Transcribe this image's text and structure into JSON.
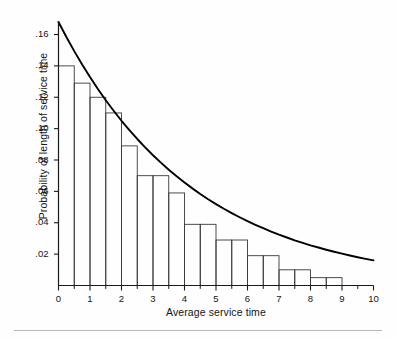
{
  "chart_data": {
    "type": "bar",
    "title": "",
    "subtitle": "",
    "xlabel": "Average service time",
    "ylabel": "Probability of length of service time",
    "xlim": [
      0,
      10
    ],
    "ylim": [
      0,
      0.172
    ],
    "grid": false,
    "legend": null,
    "bar_width": 0.5,
    "categories": [
      "0.0-0.5",
      "0.5-1.0",
      "1.0-1.5",
      "1.5-2.0",
      "2.0-2.5",
      "2.5-3.0",
      "3.0-3.5",
      "3.5-4.0",
      "4.0-4.5",
      "4.5-5.0",
      "5.0-5.5",
      "5.5-6.0",
      "6.0-6.5",
      "6.5-7.0",
      "7.0-7.5",
      "7.5-8.0",
      "8.0-8.5",
      "8.5-9.0",
      "9.0-9.5",
      "9.5-10.0"
    ],
    "bar_left_edges": [
      0,
      0.5,
      1,
      1.5,
      2,
      2.5,
      3,
      3.5,
      4,
      4.5,
      5,
      5.5,
      6,
      6.5,
      7,
      7.5,
      8,
      8.5,
      9,
      9.5
    ],
    "values": [
      0.14,
      0.129,
      0.12,
      0.11,
      0.089,
      0.07,
      0.07,
      0.059,
      0.039,
      0.039,
      0.029,
      0.029,
      0.019,
      0.019,
      0.01,
      0.01,
      0.005,
      0.005,
      0.0,
      0.0
    ],
    "curve": {
      "name": "exponential fit",
      "x": [
        0.0,
        0.25,
        0.5,
        0.75,
        1.0,
        1.25,
        1.5,
        1.75,
        2.0,
        2.25,
        2.5,
        2.75,
        3.0,
        3.25,
        3.5,
        3.75,
        4.0,
        4.25,
        4.5,
        4.75,
        5.0,
        5.25,
        5.5,
        5.75,
        6.0,
        6.25,
        6.5,
        6.75,
        7.0,
        7.25,
        7.5,
        7.75,
        8.0,
        8.25,
        8.5,
        8.75,
        9.0,
        9.25,
        9.5,
        9.75,
        10.0
      ],
      "y": [
        0.168,
        0.1584,
        0.1494,
        0.1409,
        0.1329,
        0.1253,
        0.1181,
        0.1114,
        0.105,
        0.099,
        0.0934,
        0.0881,
        0.083,
        0.0783,
        0.0738,
        0.0696,
        0.0656,
        0.0619,
        0.0583,
        0.055,
        0.0519,
        0.0489,
        0.0461,
        0.0435,
        0.041,
        0.0387,
        0.0365,
        0.0344,
        0.0324,
        0.0306,
        0.0288,
        0.0272,
        0.0256,
        0.0242,
        0.0228,
        0.0215,
        0.0203,
        0.0191,
        0.018,
        0.017,
        0.016
      ]
    },
    "yticks": [
      0.02,
      0.04,
      0.06,
      0.08,
      0.1,
      0.12,
      0.14,
      0.16
    ],
    "ytick_labels": [
      ".02",
      ".04",
      ".06",
      ".08",
      ".10",
      ".12",
      ".14",
      ".16"
    ],
    "xticks": [
      0,
      1,
      2,
      3,
      4,
      5,
      6,
      7,
      8,
      9,
      10
    ],
    "xtick_labels": [
      "0",
      "1",
      "2",
      "3",
      "4",
      "5",
      "6",
      "7",
      "8",
      "9",
      "10"
    ],
    "xminor_ticks": [
      0.5,
      1.5,
      2.5,
      3.5,
      4.5,
      5.5,
      6.5,
      7.5,
      8.5,
      9.5
    ],
    "colors": {
      "axis": "#1a1a1a",
      "bar_edge": "#3a3a3a",
      "bar_fill": "none",
      "curve": "#000000",
      "background": "#fefefe"
    }
  }
}
